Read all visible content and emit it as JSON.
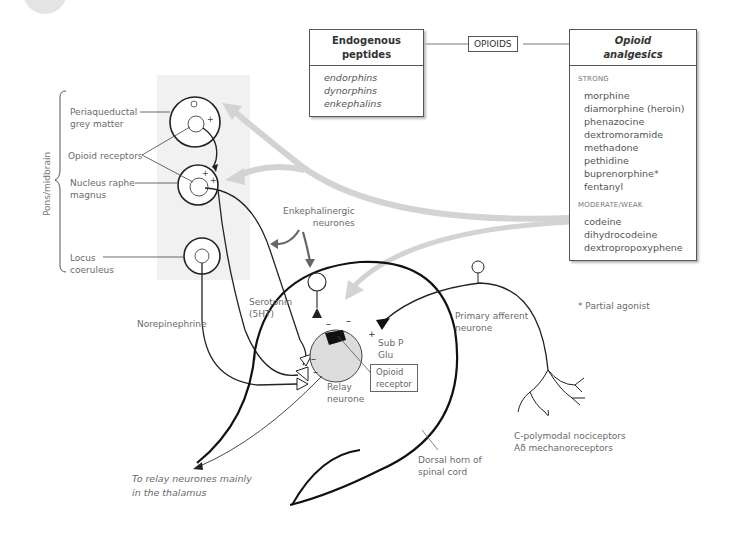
{
  "endogenous_box": {
    "title_line1": "Endogenous",
    "title_line2": "peptides",
    "items": [
      "endorphins",
      "dynorphins",
      "enkephalins"
    ]
  },
  "connector_label": "OPIOIDS",
  "analgesics_box": {
    "title_line1": "Opioid",
    "title_line2": "analgesics",
    "sections": [
      {
        "heading": "STRONG",
        "items": [
          "morphine",
          "diamorphine (heroin)",
          "phenazocine",
          "dextromoramide",
          "methadone",
          "pethidine",
          "buprenorphine*",
          "fentanyl"
        ]
      },
      {
        "heading": "MODERATE/WEAK",
        "items": [
          "codeine",
          "dihydrocodeine",
          "dextropropoxyphene"
        ]
      }
    ]
  },
  "footnote": "* Partial agonist",
  "brainstem": {
    "region_label": "Pons/midbrain",
    "periaqueductal_line1": "Periaqueductal",
    "periaqueductal_line2": "grey matter",
    "opioid_receptors": "Opioid receptors",
    "raphe_line1": "Nucleus raphe",
    "raphe_line2": "magnus",
    "locus_line1": "Locus",
    "locus_line2": "coeruleus"
  },
  "spinal": {
    "enkephalinergic_line1": "Enkephalinergic",
    "enkephalinergic_line2": "neurones",
    "serotonin_line1": "Serotonin",
    "serotonin_line2": "(5HT)",
    "norepinephrine": "Norepinephrine",
    "subp_line1": "Sub P",
    "subp_line2": "Glu",
    "opioid_receptor_line1": "Opioid",
    "opioid_receptor_line2": "receptor",
    "relay_line1": "Relay",
    "relay_line2": "neurone",
    "primary_line1": "Primary afferent",
    "primary_line2": "neurone",
    "nociceptors_line1": "C-polymodal nociceptors",
    "nociceptors_line2": "Aδ mechanoreceptors",
    "dorsal_line1": "Dorsal horn of",
    "dorsal_line2": "spinal cord",
    "thalamus_line1": "To relay neurones mainly",
    "thalamus_line2": "in the thalamus"
  },
  "signs": {
    "plus": "+",
    "minus": "–",
    "small_o": "o"
  },
  "colors": {
    "line": "#222222",
    "grey_arrow": "#d0d0d0",
    "region_shade": "#f1f1f1",
    "relay_fill": "#dcdcdc",
    "text": "#6a6a6a"
  }
}
